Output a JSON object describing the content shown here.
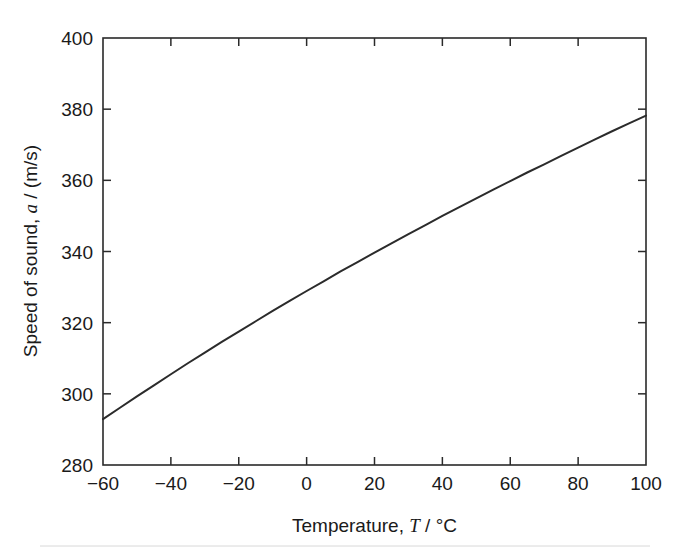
{
  "chart_data": {
    "type": "line",
    "title": "",
    "subtitle": "",
    "xlabel_parts": {
      "lead": "Temperature, ",
      "symbol": "T",
      "trail": " / °C"
    },
    "ylabel_parts": {
      "lead": "Speed of sound, ",
      "symbol": "a",
      "trail": " / (m/s)"
    },
    "xlabel": "Temperature, T / °C",
    "ylabel": "Speed of sound, a / (m/s)",
    "xlim": [
      -60,
      100
    ],
    "ylim": [
      280,
      400
    ],
    "xticks": [
      -60,
      -40,
      -20,
      0,
      20,
      40,
      60,
      80,
      100
    ],
    "xtick_labels": [
      "−60",
      "−40",
      "−20",
      "0",
      "20",
      "40",
      "60",
      "80",
      "100"
    ],
    "yticks": [
      280,
      300,
      320,
      340,
      360,
      380,
      400
    ],
    "ytick_labels": [
      "280",
      "300",
      "320",
      "340",
      "360",
      "380",
      "400"
    ],
    "grid": false,
    "legend": null,
    "legend_position": "none",
    "box": true,
    "tick_direction": "in",
    "line_color": "#2b2b2b",
    "background_color": "#ffffff",
    "series": [
      {
        "name": "Speed of sound in air",
        "x": [
          -60,
          -55,
          -50,
          -45,
          -40,
          -35,
          -30,
          -25,
          -20,
          -15,
          -10,
          -5,
          0,
          5,
          10,
          15,
          20,
          25,
          30,
          35,
          40,
          45,
          50,
          55,
          60,
          65,
          70,
          75,
          80,
          85,
          90,
          95,
          100
        ],
        "y": [
          292.9,
          296.1,
          299.3,
          302.4,
          305.5,
          308.6,
          311.6,
          314.6,
          317.5,
          320.4,
          323.3,
          326.1,
          328.9,
          331.6,
          334.4,
          337.0,
          339.7,
          342.3,
          344.9,
          347.4,
          350.0,
          352.5,
          354.9,
          357.4,
          359.8,
          362.2,
          364.5,
          366.9,
          369.2,
          371.5,
          373.8,
          376.0,
          378.2
        ]
      }
    ],
    "annotations": []
  },
  "axes": {
    "x_axis_name": "temperature-axis",
    "y_axis_name": "speed-of-sound-axis"
  }
}
